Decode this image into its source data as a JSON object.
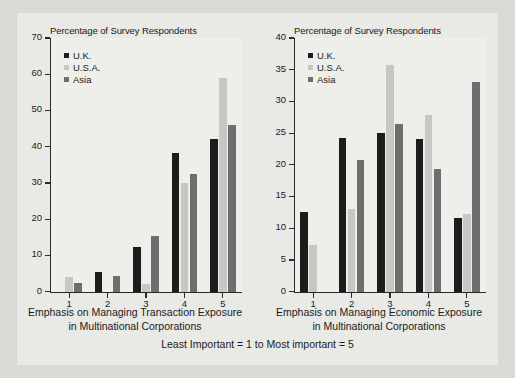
{
  "figure": {
    "caption": "Least Important = 1 to Most important = 5",
    "colors": {
      "background_outer": "#d9d9d6",
      "background_figure": "#e9e9e6",
      "background_axes": "#eeeeeb",
      "uk": "#1c1c1c",
      "usa": "#c6c6c2",
      "asia": "#6e6e6e",
      "axis": "#2a2a2a",
      "text": "#1b1b1b"
    }
  },
  "legend": {
    "entries": [
      {
        "label": "U.K.",
        "key": "uk"
      },
      {
        "label": "U.S.A.",
        "key": "usa"
      },
      {
        "label": "Asia",
        "key": "asia"
      }
    ]
  },
  "chart_data": [
    {
      "type": "bar",
      "id": "transaction-exposure",
      "title": "Percentage of Survey Respondents",
      "ylabel": "Percentage of Survey Respondents",
      "xlabel": "Emphasis on Managing Transaction Exposure in Multinational Corporations",
      "xlabel_line1": "Emphasis on Managing Transaction Exposure",
      "xlabel_line2": "in Multinational Corporations",
      "categories": [
        "1",
        "2",
        "3",
        "4",
        "5"
      ],
      "ylim": [
        0,
        70
      ],
      "yticks": [
        0,
        10,
        20,
        30,
        40,
        50,
        60,
        70
      ],
      "grid": false,
      "legend_position": "upper left",
      "series": [
        {
          "name": "U.K.",
          "key": "uk",
          "values": [
            0,
            5.5,
            12.3,
            38.2,
            42.2
          ]
        },
        {
          "name": "U.S.A.",
          "key": "usa",
          "values": [
            4.0,
            0,
            2.0,
            30.0,
            59.0
          ]
        },
        {
          "name": "Asia",
          "key": "asia",
          "values": [
            2.5,
            4.3,
            15.5,
            32.5,
            46.0
          ]
        }
      ]
    },
    {
      "type": "bar",
      "id": "economic-exposure",
      "title": "Percentage of Survey Respondents",
      "ylabel": "Percentage of Survey Respondents",
      "xlabel": "Emphasis on Managing Economic Exposure in Multinational Corporations",
      "xlabel_line1": "Emphasis on Managing Economic Exposure",
      "xlabel_line2": "in Multinational Corporations",
      "categories": [
        "1",
        "2",
        "3",
        "4",
        "5"
      ],
      "ylim": [
        0,
        40
      ],
      "yticks": [
        0,
        5,
        10,
        15,
        20,
        25,
        30,
        35,
        40
      ],
      "grid": false,
      "legend_position": "upper left",
      "series": [
        {
          "name": "U.K.",
          "key": "uk",
          "values": [
            12.5,
            24.3,
            25.0,
            24.0,
            11.7
          ]
        },
        {
          "name": "U.S.A.",
          "key": "usa",
          "values": [
            7.3,
            13.0,
            35.8,
            27.8,
            12.2
          ]
        },
        {
          "name": "Asia",
          "key": "asia",
          "values": [
            0,
            20.8,
            26.5,
            19.3,
            33.0
          ]
        }
      ]
    }
  ]
}
